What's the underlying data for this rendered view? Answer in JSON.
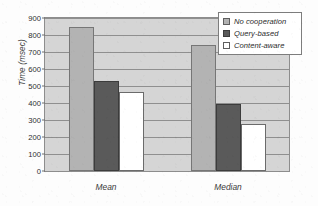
{
  "chart_data": {
    "type": "bar",
    "title": "",
    "subtitle": "",
    "xlabel": "",
    "ylabel": "Time (msec)",
    "categories": [
      "Mean",
      "Median"
    ],
    "series": [
      {
        "name": "No cooperation",
        "color": "#b3b3b3",
        "values": [
          850,
          740
        ]
      },
      {
        "name": "Query-based",
        "color": "#5a5a5a",
        "values": [
          530,
          395
        ]
      },
      {
        "name": "Content-aware",
        "color": "#ffffff",
        "values": [
          465,
          275
        ]
      }
    ],
    "ylim": [
      0,
      900
    ],
    "ytick_values": [
      0,
      100,
      200,
      300,
      400,
      500,
      600,
      700,
      800,
      900
    ],
    "ytick_labels": [
      "0",
      "100",
      "200",
      "300",
      "400",
      "500",
      "600",
      "700",
      "800",
      "900"
    ],
    "grid": "horizontal",
    "legend_position": "top-right",
    "plot_background": "#d5d5d5"
  }
}
